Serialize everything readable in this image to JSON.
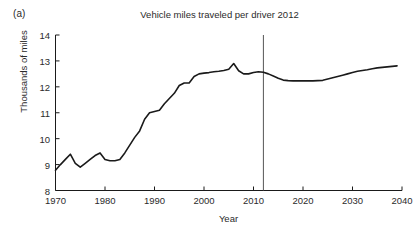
{
  "figure": {
    "panel_label": "(a)",
    "title": "Vehicle miles traveled per driver 2012",
    "background_color": "#ffffff",
    "line_color": "#1a1a1a",
    "marker_line_color": "#555555"
  },
  "chart_data": {
    "type": "line",
    "title": "Vehicle miles traveled per driver 2012",
    "xlabel": "Year",
    "ylabel": "Thousands of miles",
    "xlim": [
      1970,
      2040
    ],
    "ylim": [
      8,
      14
    ],
    "xticks": [
      1970,
      1980,
      1990,
      2000,
      2010,
      2020,
      2030,
      2040
    ],
    "yticks": [
      8,
      9,
      10,
      11,
      12,
      13,
      14
    ],
    "grid": false,
    "legend": "none",
    "annotations": [
      {
        "type": "vline",
        "x": 2012,
        "label": "2012 historical/forecast divide"
      }
    ],
    "series": [
      {
        "name": "Vehicle miles traveled per driver",
        "x": [
          1970,
          1971,
          1972,
          1973,
          1974,
          1975,
          1976,
          1977,
          1978,
          1979,
          1980,
          1981,
          1982,
          1983,
          1984,
          1985,
          1986,
          1987,
          1988,
          1989,
          1990,
          1991,
          1992,
          1993,
          1994,
          1995,
          1996,
          1997,
          1998,
          1999,
          2000,
          2001,
          2002,
          2003,
          2004,
          2005,
          2006,
          2007,
          2008,
          2009,
          2010,
          2011,
          2012,
          2013,
          2014,
          2015,
          2016,
          2017,
          2018,
          2019,
          2020,
          2021,
          2022,
          2023,
          2024,
          2025,
          2026,
          2027,
          2028,
          2029,
          2030,
          2031,
          2032,
          2033,
          2034,
          2035,
          2036,
          2037,
          2038,
          2039
        ],
        "y": [
          8.78,
          9.0,
          9.2,
          9.4,
          9.05,
          8.9,
          9.05,
          9.2,
          9.35,
          9.45,
          9.2,
          9.15,
          9.15,
          9.2,
          9.45,
          9.75,
          10.05,
          10.3,
          10.75,
          11.0,
          11.05,
          11.1,
          11.35,
          11.55,
          11.75,
          12.05,
          12.15,
          12.15,
          12.4,
          12.5,
          12.53,
          12.55,
          12.58,
          12.6,
          12.63,
          12.68,
          12.9,
          12.62,
          12.5,
          12.5,
          12.55,
          12.58,
          12.56,
          12.5,
          12.42,
          12.33,
          12.26,
          12.24,
          12.23,
          12.23,
          12.23,
          12.23,
          12.23,
          12.24,
          12.25,
          12.3,
          12.35,
          12.4,
          12.45,
          12.5,
          12.55,
          12.6,
          12.63,
          12.66,
          12.7,
          12.73,
          12.75,
          12.77,
          12.79,
          12.81
        ]
      }
    ]
  },
  "axes": {
    "y_title": "Thousands of miles",
    "x_title": "Year",
    "y_tick_labels": [
      "14",
      "13",
      "12",
      "11",
      "10",
      "9",
      "8"
    ],
    "x_tick_labels": [
      "1970",
      "1980",
      "1990",
      "2000",
      "2010",
      "2020",
      "2030",
      "2040"
    ]
  }
}
